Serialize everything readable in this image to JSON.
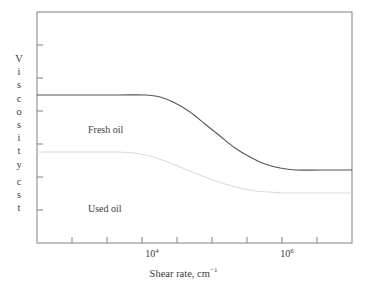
{
  "chart_data": {
    "type": "line",
    "title": "",
    "xlabel": "Shear rate, cm⁻¹",
    "ylabel": "Viscosity, cst",
    "xscale": "log",
    "yscale": "linear",
    "grid": false,
    "legend": "inline-annotations",
    "xticklabels": [
      "10⁴",
      "10⁶"
    ],
    "xtick_positions_px": [
      152,
      287
    ],
    "ytick_count": 7,
    "yticklabels": [],
    "series": [
      {
        "name": "Fresh oil",
        "color": "#555555",
        "plateau_high_px_y": 95,
        "plateau_low_px_y": 170,
        "transition_start_px_x": 145,
        "transition_end_px_x": 285,
        "points_px": [
          [
            37,
            95
          ],
          [
            60,
            95
          ],
          [
            90,
            95
          ],
          [
            120,
            95
          ],
          [
            145,
            95
          ],
          [
            160,
            97
          ],
          [
            175,
            103
          ],
          [
            190,
            112
          ],
          [
            205,
            124
          ],
          [
            220,
            136
          ],
          [
            235,
            148
          ],
          [
            250,
            157
          ],
          [
            265,
            164
          ],
          [
            280,
            168
          ],
          [
            295,
            170
          ],
          [
            320,
            170
          ],
          [
            352,
            170
          ]
        ]
      },
      {
        "name": "Used oil",
        "color": "#dcdcdc",
        "plateau_high_px_y": 152,
        "plateau_low_px_y": 193,
        "transition_start_px_x": 135,
        "transition_end_px_x": 275,
        "points_px": [
          [
            37,
            152
          ],
          [
            60,
            152
          ],
          [
            90,
            152
          ],
          [
            118,
            152
          ],
          [
            135,
            153
          ],
          [
            150,
            156
          ],
          [
            165,
            161
          ],
          [
            180,
            167
          ],
          [
            195,
            173
          ],
          [
            210,
            179
          ],
          [
            225,
            184
          ],
          [
            240,
            188
          ],
          [
            255,
            191
          ],
          [
            270,
            192
          ],
          [
            285,
            193
          ],
          [
            320,
            193
          ],
          [
            352,
            193
          ]
        ]
      }
    ],
    "annotations": [
      {
        "text": "Fresh oil",
        "x_px": 88,
        "y_px": 131
      },
      {
        "text": "Used oil",
        "x_px": 88,
        "y_px": 210
      }
    ],
    "plot_frame_px": {
      "left": 37,
      "top": 12,
      "right": 352,
      "bottom": 243
    },
    "frame_color": "#808080",
    "background": "#ffffff"
  },
  "y_axis_letters": [
    "V",
    "i",
    "s",
    "c",
    "o",
    "s",
    "i",
    "t",
    "y",
    "",
    "c",
    "s",
    "t"
  ],
  "axis": {
    "y_title": "Viscosity, cst",
    "x_title_main": "Shear rate, cm",
    "x_title_sup": "−1",
    "xtick_1_mantissa": "10",
    "xtick_1_exp": "4",
    "xtick_2_mantissa": "10",
    "xtick_2_exp": "6"
  },
  "labels": {
    "fresh_oil": "Fresh oil",
    "used_oil": "Used oil"
  }
}
